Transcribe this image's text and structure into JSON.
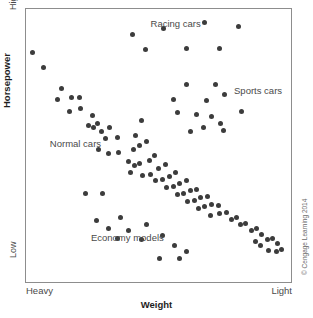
{
  "chart_data": {
    "type": "scatter",
    "title": "",
    "xlabel": "Weight",
    "ylabel": "Horsepower",
    "xtick_labels": [
      "Heavy",
      "Light"
    ],
    "ytick_labels": [
      "High",
      "Low"
    ],
    "xlim": [
      0,
      100
    ],
    "ylim": [
      0,
      100
    ],
    "grid": false,
    "legend": "none",
    "marker_color": "#3c3c3c",
    "frame_color": "#8d8d8d",
    "annotations": [
      {
        "text": "Racing cars",
        "x": 47.0,
        "y": 94.5
      },
      {
        "text": "Sports cars",
        "x": 78.5,
        "y": 70.0
      },
      {
        "text": "Normal cars",
        "x": 9.0,
        "y": 50.5
      },
      {
        "text": "Economy models",
        "x": 24.5,
        "y": 16.0
      }
    ],
    "series": [
      {
        "name": "Normal cars",
        "points": [
          [
            2.5,
            84.0
          ],
          [
            6.5,
            78.5
          ],
          [
            13.5,
            71.0
          ],
          [
            12.0,
            67.0
          ],
          [
            17.0,
            67.5
          ],
          [
            20.0,
            67.5
          ],
          [
            16.5,
            62.5
          ],
          [
            20.5,
            63.5
          ],
          [
            25.0,
            61.0
          ],
          [
            23.5,
            57.5
          ],
          [
            25.5,
            56.5
          ],
          [
            27.0,
            58.0
          ],
          [
            28.5,
            55.0
          ],
          [
            31.5,
            56.5
          ],
          [
            30.0,
            52.5
          ],
          [
            34.5,
            53.0
          ],
          [
            27.5,
            48.5
          ],
          [
            31.0,
            47.0
          ],
          [
            35.0,
            47.5
          ],
          [
            40.5,
            48.5
          ],
          [
            43.5,
            59.0
          ],
          [
            41.5,
            53.5
          ],
          [
            43.0,
            50.0
          ],
          [
            45.5,
            51.5
          ],
          [
            38.5,
            44.0
          ],
          [
            41.0,
            42.5
          ],
          [
            43.0,
            43.5
          ],
          [
            46.5,
            44.5
          ],
          [
            48.5,
            46.5
          ],
          [
            39.5,
            40.0
          ],
          [
            44.0,
            39.0
          ],
          [
            47.0,
            39.5
          ],
          [
            50.0,
            41.5
          ],
          [
            52.5,
            43.0
          ],
          [
            49.0,
            37.0
          ],
          [
            51.5,
            37.5
          ],
          [
            54.0,
            38.5
          ],
          [
            56.5,
            40.0
          ],
          [
            53.0,
            34.5
          ],
          [
            55.5,
            35.0
          ],
          [
            58.0,
            36.0
          ],
          [
            60.5,
            37.0
          ],
          [
            57.0,
            32.0
          ],
          [
            59.5,
            32.5
          ],
          [
            62.0,
            33.5
          ],
          [
            64.5,
            34.0
          ],
          [
            61.0,
            29.5
          ],
          [
            63.5,
            30.0
          ],
          [
            66.0,
            31.0
          ],
          [
            68.5,
            31.5
          ],
          [
            65.0,
            27.0
          ],
          [
            67.5,
            27.5
          ],
          [
            70.0,
            28.5
          ],
          [
            72.5,
            28.0
          ],
          [
            69.5,
            24.5
          ],
          [
            73.0,
            25.0
          ],
          [
            75.5,
            25.5
          ],
          [
            77.5,
            23.0
          ],
          [
            79.5,
            23.5
          ],
          [
            81.0,
            21.0
          ],
          [
            83.0,
            21.5
          ],
          [
            85.0,
            19.0
          ],
          [
            87.0,
            19.5
          ],
          [
            89.0,
            17.5
          ],
          [
            91.0,
            15.5
          ],
          [
            93.0,
            16.0
          ],
          [
            95.0,
            14.0
          ],
          [
            96.5,
            12.0
          ],
          [
            91.5,
            11.5
          ],
          [
            94.5,
            11.0
          ],
          [
            86.5,
            15.0
          ],
          [
            88.5,
            13.5
          ]
        ]
      },
      {
        "name": "Racing cars",
        "points": [
          [
            40.0,
            90.5
          ],
          [
            52.0,
            93.0
          ],
          [
            67.5,
            95.0
          ],
          [
            80.0,
            93.5
          ],
          [
            45.0,
            85.0
          ],
          [
            60.5,
            85.5
          ],
          [
            73.0,
            85.5
          ]
        ]
      },
      {
        "name": "Sports cars",
        "points": [
          [
            60.5,
            72.5
          ],
          [
            71.5,
            72.5
          ],
          [
            55.5,
            67.0
          ],
          [
            68.0,
            66.5
          ],
          [
            75.0,
            68.5
          ],
          [
            57.0,
            62.0
          ],
          [
            64.5,
            61.5
          ],
          [
            70.0,
            60.5
          ],
          [
            73.5,
            58.0
          ],
          [
            81.5,
            62.5
          ],
          [
            67.0,
            56.5
          ],
          [
            74.5,
            55.5
          ],
          [
            62.0,
            55.0
          ]
        ]
      },
      {
        "name": "Economy models",
        "points": [
          [
            22.5,
            32.5
          ],
          [
            29.0,
            32.5
          ],
          [
            26.5,
            22.5
          ],
          [
            35.5,
            23.5
          ],
          [
            31.0,
            19.5
          ],
          [
            38.5,
            19.0
          ],
          [
            45.5,
            21.0
          ],
          [
            34.5,
            16.0
          ],
          [
            43.5,
            15.5
          ],
          [
            51.5,
            17.0
          ],
          [
            56.0,
            13.5
          ],
          [
            50.5,
            8.5
          ],
          [
            58.0,
            8.5
          ],
          [
            60.5,
            11.0
          ]
        ]
      }
    ]
  },
  "credit": {
    "text": "© Cengage Learning 2014"
  }
}
